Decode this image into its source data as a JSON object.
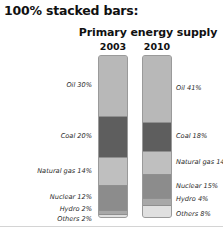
{
  "page_title": "100% stacked bars:",
  "chart_data": {
    "type": "bar",
    "stacked": true,
    "stacked_100pct": true,
    "title": "Primary energy supply",
    "xlabel": "",
    "ylabel": "",
    "ylim": [
      0,
      100
    ],
    "grid": false,
    "legend_position": "inline-labels",
    "categories": [
      "2003",
      "2010"
    ],
    "series": [
      {
        "name": "Oil",
        "values": [
          30,
          41
        ],
        "color": "#b8b8b8"
      },
      {
        "name": "Coal",
        "values": [
          20,
          18
        ],
        "color": "#5e5e5e"
      },
      {
        "name": "Natural gas",
        "values": [
          14,
          14
        ],
        "color": "#bfbfbf"
      },
      {
        "name": "Nuclear",
        "values": [
          12,
          15
        ],
        "color": "#8c8c8c"
      },
      {
        "name": "Hydro",
        "values": [
          2,
          4
        ],
        "color": "#a8a8a8"
      },
      {
        "name": "Others",
        "values": [
          2,
          8
        ],
        "color": "#e0e0e0"
      }
    ],
    "labels_2003": [
      "Oil 30%",
      "Coal 20%",
      "Natural gas 14%",
      "Nuclear 12%",
      "Hydro 2%",
      "Others 2%"
    ],
    "labels_2010": [
      "Oil 41%",
      "Coal 18%",
      "Natural gas 14%",
      "Nuclear 15%",
      "Hydro 4%",
      "Others 8%"
    ]
  }
}
